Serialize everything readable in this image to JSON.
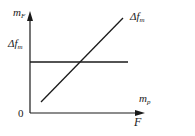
{
  "diagram": {
    "y_axis": {
      "label_main": "m",
      "label_sub": "F"
    },
    "x_axis": {
      "label_upper_main": "m",
      "label_upper_sub": "p",
      "label_lower": "F"
    },
    "origin_label": "0",
    "horizontal_line": {
      "label_main": "Δf",
      "label_sub": "m"
    },
    "diagonal_line": {
      "label_main": "Δf",
      "label_sub": "m"
    },
    "colors": {
      "line": "#1a1a1a",
      "background": "#ffffff"
    }
  }
}
